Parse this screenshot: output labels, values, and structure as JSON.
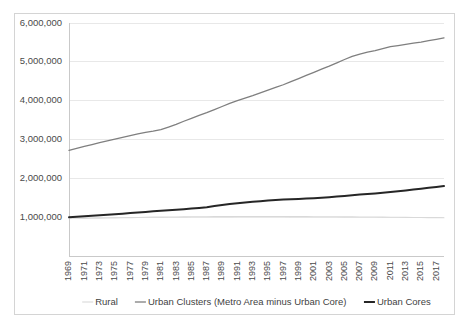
{
  "chart_data": {
    "type": "line",
    "title": "",
    "subtitle": "",
    "xlabel": "",
    "ylabel": "",
    "ylim": [
      0,
      6000000
    ],
    "xlim": [
      1969,
      2018
    ],
    "grid": true,
    "legend_position": "bottom",
    "y_ticks": [
      1000000,
      2000000,
      3000000,
      4000000,
      5000000,
      6000000
    ],
    "y_tick_labels": [
      "1,000,000",
      "2,000,000",
      "3,000,000",
      "4,000,000",
      "5,000,000",
      "6,000,000"
    ],
    "x": [
      1969,
      1970,
      1971,
      1972,
      1973,
      1974,
      1975,
      1976,
      1977,
      1978,
      1979,
      1980,
      1981,
      1982,
      1983,
      1984,
      1985,
      1986,
      1987,
      1988,
      1989,
      1990,
      1991,
      1992,
      1993,
      1994,
      1995,
      1996,
      1997,
      1998,
      1999,
      2000,
      2001,
      2002,
      2003,
      2004,
      2005,
      2006,
      2007,
      2008,
      2009,
      2010,
      2011,
      2012,
      2013,
      2014,
      2015,
      2016,
      2017,
      2018
    ],
    "x_tick_labels": [
      "1969",
      "1971",
      "1973",
      "1975",
      "1977",
      "1979",
      "1981",
      "1983",
      "1985",
      "1987",
      "1989",
      "1991",
      "1993",
      "1995",
      "1997",
      "1999",
      "2001",
      "2003",
      "2005",
      "2007",
      "2009",
      "2011",
      "2013",
      "2015",
      "2017"
    ],
    "series": [
      {
        "name": "Rural",
        "color": "#d9d9d9",
        "width": 1.1,
        "values": [
          975000,
          972000,
          970000,
          972000,
          975000,
          978000,
          982000,
          985000,
          988000,
          992000,
          996000,
          1000000,
          1002000,
          1004000,
          1006000,
          1008000,
          1010000,
          1011000,
          1012000,
          1013000,
          1014000,
          1015000,
          1016000,
          1017000,
          1018000,
          1018000,
          1018000,
          1017000,
          1016000,
          1015000,
          1014000,
          1013000,
          1012000,
          1011000,
          1010000,
          1009000,
          1008000,
          1007000,
          1006000,
          1005000,
          1003000,
          1001000,
          999000,
          997000,
          995000,
          993000,
          991000,
          989000,
          987000,
          985000
        ]
      },
      {
        "name": "Urban Clusters (Metro Area minus Urban Core)",
        "color": "#7f7f7f",
        "width": 1.3,
        "values": [
          2720000,
          2770000,
          2820000,
          2870000,
          2920000,
          2965000,
          3010000,
          3055000,
          3100000,
          3145000,
          3185000,
          3215000,
          3255000,
          3320000,
          3390000,
          3470000,
          3545000,
          3620000,
          3690000,
          3770000,
          3850000,
          3930000,
          4000000,
          4065000,
          4130000,
          4200000,
          4270000,
          4340000,
          4410000,
          4490000,
          4570000,
          4650000,
          4730000,
          4810000,
          4890000,
          4975000,
          5060000,
          5140000,
          5200000,
          5250000,
          5290000,
          5340000,
          5390000,
          5420000,
          5450000,
          5480000,
          5510000,
          5545000,
          5580000,
          5615000
        ]
      },
      {
        "name": "Urban Cores",
        "color": "#262626",
        "width": 2.0,
        "values": [
          1000000,
          1010000,
          1022000,
          1035000,
          1048000,
          1062000,
          1075000,
          1090000,
          1105000,
          1120000,
          1135000,
          1150000,
          1163000,
          1176000,
          1190000,
          1205000,
          1220000,
          1238000,
          1258000,
          1285000,
          1312000,
          1340000,
          1360000,
          1378000,
          1395000,
          1412000,
          1430000,
          1442000,
          1452000,
          1460000,
          1468000,
          1478000,
          1490000,
          1502000,
          1515000,
          1530000,
          1548000,
          1565000,
          1582000,
          1598000,
          1612000,
          1628000,
          1648000,
          1668000,
          1688000,
          1710000,
          1732000,
          1755000,
          1778000,
          1800000
        ]
      }
    ]
  },
  "legend": {
    "items": [
      {
        "label": "Rural",
        "color": "#d9d9d9"
      },
      {
        "label": "Urban Clusters (Metro Area minus Urban Core)",
        "color": "#7f7f7f"
      },
      {
        "label": "Urban Cores",
        "color": "#262626"
      }
    ]
  }
}
